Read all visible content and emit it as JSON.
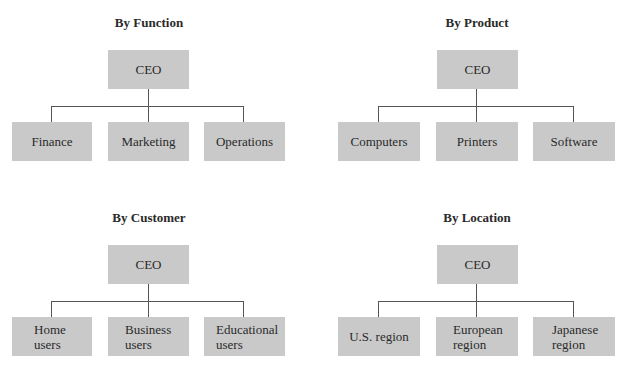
{
  "charts": [
    {
      "title": "By Function",
      "root": "CEO",
      "children": [
        "Finance",
        "Marketing",
        "Operations"
      ]
    },
    {
      "title": "By Product",
      "root": "CEO",
      "children": [
        "Computers",
        "Printers",
        "Software"
      ]
    },
    {
      "title": "By Customer",
      "root": "CEO",
      "children": [
        "Home\nusers",
        "Business\nusers",
        "Educational\nusers"
      ]
    },
    {
      "title": "By Location",
      "root": "CEO",
      "children": [
        "U.S. region",
        "European\nregion",
        "Japanese\nregion"
      ]
    }
  ],
  "colors": {
    "box_fill": "#c9c9c9",
    "connector": "#555555",
    "text": "#2a2a2a"
  }
}
